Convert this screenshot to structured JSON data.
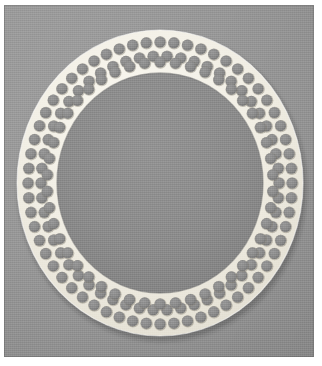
{
  "figure": {
    "caption": "",
    "medium": "photograph"
  },
  "photo": {
    "background_color": "#959595",
    "backdrop_highlight_color": "#9e9e9e",
    "backdrop_shadow_color": "#858585",
    "margin_color": "#ffffff",
    "x": 4,
    "y": 5,
    "width": 310,
    "height": 352
  },
  "object": {
    "name": "annular perforated plate",
    "shape": "ring",
    "plate_color": "#f3f0e7",
    "plate_shadow_color": "#d9d5c9",
    "hole_color": "#8d8d8d",
    "hole_shadow_color": "#6f6f6f",
    "inner_disc_color": "#8c8c8c",
    "center_x": 156,
    "center_y": 178,
    "outer_radius_x": 143,
    "outer_radius_y": 153,
    "inner_radius_x": 103,
    "inner_radius_y": 110,
    "band_width": 40,
    "hole_rows": 3,
    "hole_diameter": 11,
    "holes_per_row": [
      60,
      54,
      46
    ],
    "total_holes": 160
  },
  "chart_data": {
    "type": "scatter",
    "xlabel": "",
    "ylabel": "",
    "rings": [
      {
        "name": "outer row",
        "radius_x": 132,
        "radius_y": 141,
        "count": 60,
        "hole_diameter": 11
      },
      {
        "name": "middle row",
        "radius_x": 119,
        "radius_y": 127,
        "count": 54,
        "hole_diameter": 11
      },
      {
        "name": "inner row",
        "radius_x": 113,
        "radius_y": 121,
        "count": 46,
        "hole_diameter": 11
      }
    ]
  }
}
